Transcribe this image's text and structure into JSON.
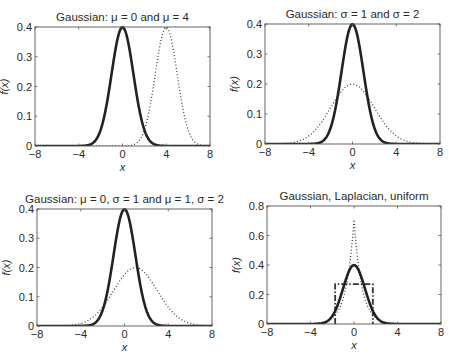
{
  "figure": {
    "width": 449,
    "height": 356,
    "background": "#ffffff",
    "line_color": "#222222"
  },
  "chart_data": [
    {
      "type": "line",
      "title": "Gaussian: μ = 0 and μ = 4",
      "xlabel": "x",
      "ylabel": "f(x)",
      "xlim": [
        -8,
        8
      ],
      "ylim": [
        0,
        0.4
      ],
      "xticks": [
        -8,
        -4,
        0,
        4,
        8
      ],
      "xticklabels": [
        "−8",
        "−4",
        "0",
        "4",
        "8"
      ],
      "yticks": [
        0,
        0.1,
        0.2,
        0.3,
        0.4
      ],
      "yticklabels": [
        "0",
        "0.1",
        "0.2",
        "0.3",
        "0.4"
      ],
      "grid": false,
      "legend": null,
      "box": {
        "left": 35,
        "top": 27,
        "right": 210,
        "bottom": 146
      },
      "series": [
        {
          "name": "Gaussian μ=0, σ=1",
          "dist": "gaussian",
          "mu": 0,
          "sigma": 1,
          "style": "solid",
          "peak": 0.399
        },
        {
          "name": "Gaussian μ=4, σ=1",
          "dist": "gaussian",
          "mu": 4,
          "sigma": 1,
          "style": "dotted",
          "peak": 0.399
        }
      ]
    },
    {
      "type": "line",
      "title": "Gaussian: σ = 1 and σ = 2",
      "xlabel": "x",
      "ylabel": "f(x)",
      "xlim": [
        -8,
        8
      ],
      "ylim": [
        0,
        0.4
      ],
      "xticks": [
        -8,
        -4,
        0,
        4,
        8
      ],
      "xticklabels": [
        "−8",
        "−4",
        "0",
        "4",
        "8"
      ],
      "yticks": [
        0,
        0.1,
        0.2,
        0.3,
        0.4
      ],
      "yticklabels": [
        "0",
        "0.1",
        "0.2",
        "0.3",
        "0.4"
      ],
      "grid": false,
      "legend": null,
      "box": {
        "left": 265,
        "top": 24,
        "right": 440,
        "bottom": 144
      },
      "series": [
        {
          "name": "Gaussian μ=0, σ=1",
          "dist": "gaussian",
          "mu": 0,
          "sigma": 1,
          "style": "solid",
          "peak": 0.399
        },
        {
          "name": "Gaussian μ=0, σ=2",
          "dist": "gaussian",
          "mu": 0,
          "sigma": 2,
          "style": "dotted",
          "peak": 0.199
        }
      ]
    },
    {
      "type": "line",
      "title": "Gaussian: μ = 0, σ = 1 and μ = 1, σ = 2",
      "xlabel": "x",
      "ylabel": "f(x)",
      "xlim": [
        -8,
        8
      ],
      "ylim": [
        0,
        0.4
      ],
      "xticks": [
        -8,
        -4,
        0,
        4,
        8
      ],
      "xticklabels": [
        "−8",
        "−4",
        "0",
        "4",
        "8"
      ],
      "yticks": [
        0,
        0.1,
        0.2,
        0.3,
        0.4
      ],
      "yticklabels": [
        "0",
        "0.1",
        "0.2",
        "0.3",
        "0.4"
      ],
      "grid": false,
      "legend": null,
      "box": {
        "left": 37,
        "top": 209,
        "right": 212,
        "bottom": 326
      },
      "series": [
        {
          "name": "Gaussian μ=0, σ=1",
          "dist": "gaussian",
          "mu": 0,
          "sigma": 1,
          "style": "solid",
          "peak": 0.399
        },
        {
          "name": "Gaussian μ=1, σ=2",
          "dist": "gaussian",
          "mu": 1,
          "sigma": 2,
          "style": "dotted",
          "peak": 0.199
        }
      ]
    },
    {
      "type": "line",
      "title": "Gaussian, Laplacian, uniform",
      "xlabel": "x",
      "ylabel": "f(x)",
      "xlim": [
        -8,
        8
      ],
      "ylim": [
        0,
        0.8
      ],
      "xticks": [
        -8,
        -4,
        0,
        4,
        8
      ],
      "xticklabels": [
        "−8",
        "−4",
        "0",
        "4",
        "8"
      ],
      "yticks": [
        0,
        0.2,
        0.4,
        0.6,
        0.8
      ],
      "yticklabels": [
        "0",
        "0.2",
        "0.4",
        "0.6",
        "0.8"
      ],
      "grid": false,
      "legend": null,
      "box": {
        "left": 267,
        "top": 206,
        "right": 441,
        "bottom": 324
      },
      "series": [
        {
          "name": "Gaussian μ=0, σ=1",
          "dist": "gaussian",
          "mu": 0,
          "sigma": 1,
          "style": "solid",
          "peak": 0.399
        },
        {
          "name": "Laplacian, variance 1",
          "dist": "laplacian",
          "mu": 0,
          "b": 0.7071,
          "style": "dotted",
          "peak": 0.707
        },
        {
          "name": "Uniform, variance 1",
          "dist": "uniform",
          "a": -1.732,
          "b": 1.732,
          "style": "dashdot",
          "height": 0.27
        }
      ]
    }
  ]
}
